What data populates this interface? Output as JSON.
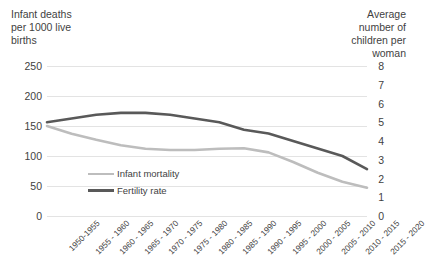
{
  "chart_data": {
    "type": "line",
    "title": "",
    "categories": [
      "1950-1955",
      "1955 - 1960",
      "1960 - 1965",
      "1965 - 1970",
      "1970 - 1975",
      "1975 - 1980",
      "1980 - 1985",
      "1985 - 1990",
      "1990 - 1995",
      "1995 - 2000",
      "2000 - 2005",
      "2005 - 2010",
      "2010 - 2015",
      "2015 - 2020"
    ],
    "series": [
      {
        "name": "Infant mortality",
        "axis": "left",
        "color": "#bdbdbd",
        "values": [
          150,
          137,
          127,
          118,
          112,
          110,
          110,
          112,
          113,
          106,
          90,
          72,
          57,
          47
        ]
      },
      {
        "name": "Fertility rate",
        "axis": "right",
        "color": "#595959",
        "values": [
          5.0,
          5.2,
          5.4,
          5.5,
          5.5,
          5.4,
          5.2,
          5.0,
          4.6,
          4.4,
          4.0,
          3.6,
          3.2,
          2.5
        ]
      }
    ],
    "left_axis": {
      "label": "Infant deaths\nper 1000 live\nbirths",
      "ticks": [
        "250",
        "200",
        "150",
        "100",
        "50",
        "0"
      ],
      "min": 0,
      "max": 250,
      "step": 50
    },
    "right_axis": {
      "label": "Average\nnumber of\nchildren per\nwoman",
      "ticks": [
        "8",
        "7",
        "6",
        "5",
        "4",
        "3",
        "2",
        "1",
        "0"
      ],
      "min": 0,
      "max": 8,
      "step": 1
    },
    "xlabel": "",
    "grid": true,
    "legend_position": "inside-bottom-left",
    "legend": [
      {
        "label": "Infant mortality",
        "color": "#bdbdbd"
      },
      {
        "label": "Fertility rate",
        "color": "#595959"
      }
    ],
    "colors": {
      "background": "#ffffff",
      "gridline": "#e3e3e3",
      "text": "#3f3f3f",
      "infant_mortality": "#bdbdbd",
      "fertility_rate": "#595959"
    }
  }
}
